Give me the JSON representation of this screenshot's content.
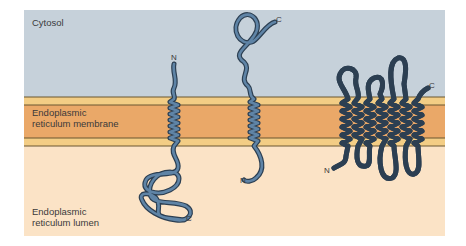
{
  "diagram": {
    "regions": [
      {
        "id": "cytosol",
        "label": "Cytosol",
        "color": "#c6d1da"
      },
      {
        "id": "membrane",
        "label_line1": "Endoplasmic",
        "label_line2": "reticulum membrane",
        "color": "#eaa868",
        "leaflet_color": "#f3cd85",
        "border_color": "#5a4a2a"
      },
      {
        "id": "lumen",
        "label_line1": "Endoplasmic",
        "label_line2": "reticulum lumen",
        "color": "#fbe3c6"
      }
    ],
    "proteins": [
      {
        "name": "single-pass type II",
        "cytosol_terminus": "N",
        "lumen_terminus": "C"
      },
      {
        "name": "single-pass type I",
        "cytosol_terminus": "C",
        "lumen_terminus": "N"
      },
      {
        "name": "multi-pass",
        "cytosol_terminus": "C",
        "lumen_terminus": "N",
        "transmembrane_segments": 7
      }
    ],
    "protein_color": "#4d6f8e",
    "protein_outline": "#2c3f52"
  }
}
